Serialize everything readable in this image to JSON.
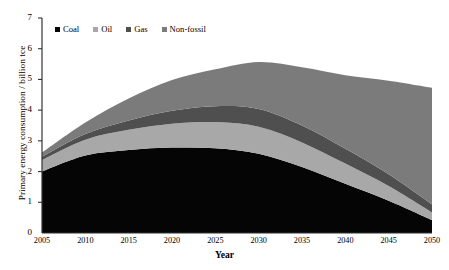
{
  "chart_data": {
    "type": "area",
    "stacked": true,
    "title": "",
    "xlabel": "Year",
    "ylabel": "Primary energy consumption / billion tce",
    "x": [
      2005,
      2010,
      2015,
      2020,
      2025,
      2030,
      2035,
      2040,
      2045,
      2050
    ],
    "xlim": [
      2005,
      2050
    ],
    "ylim": [
      0,
      7
    ],
    "yticks": [
      0,
      1,
      2,
      3,
      4,
      5,
      6,
      7
    ],
    "xticks": [
      2005,
      2010,
      2015,
      2020,
      2025,
      2030,
      2035,
      2040,
      2045,
      2050
    ],
    "grid": false,
    "legend_position": "top-left",
    "series": [
      {
        "name": "Coal",
        "color": "#050505",
        "values": [
          2.0,
          2.52,
          2.7,
          2.78,
          2.76,
          2.58,
          2.15,
          1.6,
          1.05,
          0.42
        ]
      },
      {
        "name": "Oil",
        "color": "#a8a8a8",
        "values": [
          0.38,
          0.52,
          0.66,
          0.78,
          0.85,
          0.88,
          0.8,
          0.66,
          0.48,
          0.25
        ]
      },
      {
        "name": "Gas",
        "color": "#4f4f4f",
        "values": [
          0.1,
          0.18,
          0.3,
          0.42,
          0.52,
          0.58,
          0.55,
          0.48,
          0.38,
          0.26
        ]
      },
      {
        "name": "Non-fossil",
        "color": "#7b7b7b",
        "values": [
          0.14,
          0.38,
          0.72,
          1.0,
          1.2,
          1.53,
          1.9,
          2.4,
          3.05,
          3.8
        ]
      }
    ]
  },
  "axis": {
    "y_tick_labels": [
      "0",
      "1",
      "2",
      "3",
      "4",
      "5",
      "6",
      "7"
    ],
    "x_tick_labels": [
      "2005",
      "2010",
      "2015",
      "2020",
      "2025",
      "2030",
      "2035",
      "2040",
      "2045",
      "2050"
    ],
    "y_title": "Primary energy consumption / billion tce",
    "x_title": "Year"
  },
  "legend": {
    "items": [
      {
        "label": "Coal",
        "color": "#050505"
      },
      {
        "label": "Oil",
        "color": "#a8a8a8"
      },
      {
        "label": "Gas",
        "color": "#4f4f4f"
      },
      {
        "label": "Non-fossil",
        "color": "#7b7b7b"
      }
    ]
  },
  "colors": {
    "axis": "#333333",
    "background": "#ffffff",
    "text": "#000000"
  }
}
